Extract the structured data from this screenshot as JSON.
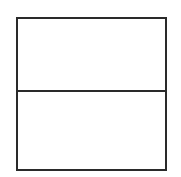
{
  "figure": {
    "kind": "two-cell-rectangle",
    "line_color": "#2a2a2a",
    "background_color": "#ffffff",
    "cells": [
      {
        "position": "top",
        "content": ""
      },
      {
        "position": "bottom",
        "content": ""
      }
    ]
  }
}
